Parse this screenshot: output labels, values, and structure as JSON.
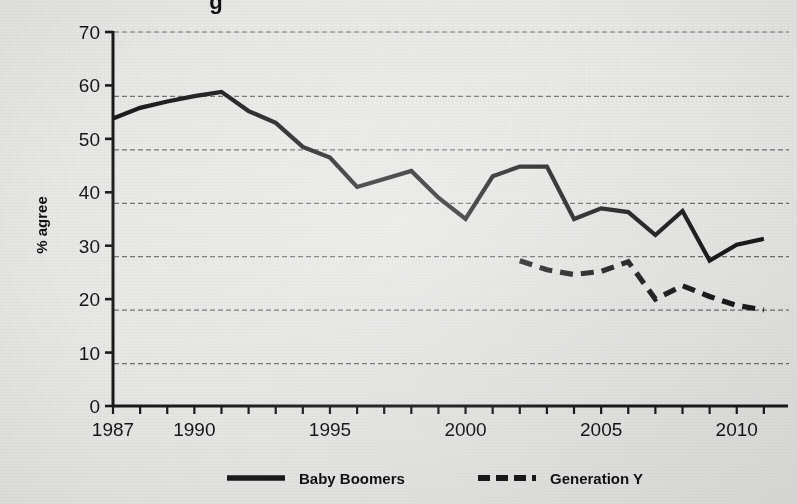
{
  "figure": {
    "background_color": "#e8e8e6",
    "ink_color": "#1a1a1a",
    "title_fragment": "g",
    "y_axis_title": "% agree"
  },
  "legend": {
    "position": "bottom",
    "entries": [
      {
        "label": "Baby Boomers",
        "style": "solid",
        "key": "baby-boomers"
      },
      {
        "label": "Generation Y",
        "style": "dashed",
        "key": "generation-y"
      }
    ]
  },
  "chart_data": {
    "type": "line",
    "title": "",
    "xlabel": "",
    "ylabel": "% agree",
    "xlim": [
      1987,
      2011.3
    ],
    "ylim": [
      0,
      70
    ],
    "yticks": [
      0,
      10,
      20,
      30,
      40,
      50,
      60,
      70
    ],
    "ytick_labels": [
      "0",
      "10",
      "20",
      "30",
      "40",
      "50",
      "60",
      "70"
    ],
    "xticks": [
      1987,
      1988,
      1989,
      1990,
      1991,
      1992,
      1993,
      1994,
      1995,
      1996,
      1997,
      1998,
      1999,
      2000,
      2001,
      2002,
      2003,
      2004,
      2005,
      2006,
      2007,
      2008,
      2009,
      2010,
      2011
    ],
    "xtick_labels_shown": [
      "1987",
      "1990",
      "1995",
      "2000",
      "2005",
      "2010"
    ],
    "xtick_labels_shown_values": [
      1987,
      1990,
      1995,
      2000,
      2005,
      2010
    ],
    "grid": true,
    "grid_axis": "y",
    "grid_style": "dashed",
    "grid_values": [
      10,
      20,
      30,
      40,
      50,
      60,
      70
    ],
    "legend_position": "bottom",
    "series": [
      {
        "name": "Baby Boomers",
        "style": "solid",
        "color": "#1a1a1a",
        "x": [
          1987,
          1988,
          1989,
          1990,
          1991,
          1992,
          1993,
          1994,
          1995,
          1996,
          1997,
          1998,
          1999,
          2000,
          2001,
          2002,
          2003,
          2004,
          2005,
          2006,
          2007,
          2008,
          2009,
          2010,
          2011
        ],
        "values": [
          53.8,
          55.8,
          57.0,
          58.0,
          58.8,
          55.2,
          53.0,
          48.5,
          46.5,
          41.0,
          42.5,
          44.0,
          39.0,
          35.0,
          43.0,
          44.8,
          44.8,
          35.0,
          37.0,
          36.3,
          32.0,
          36.5,
          27.2,
          30.2,
          31.3
        ]
      },
      {
        "name": "Generation Y",
        "style": "dashed",
        "color": "#1a1a1a",
        "x": [
          2002,
          2003,
          2004,
          2005,
          2006,
          2007,
          2008,
          2009,
          2010,
          2011
        ],
        "values": [
          27.2,
          25.5,
          24.6,
          25.2,
          27.0,
          20.0,
          22.5,
          20.5,
          18.8,
          18.0
        ]
      }
    ]
  }
}
